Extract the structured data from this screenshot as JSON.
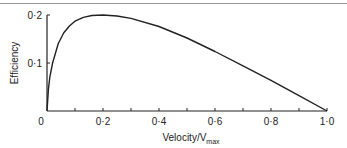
{
  "chart_data": {
    "type": "line",
    "title": "",
    "xlabel": "Velocity/V",
    "xlabel_sub": "max",
    "ylabel": "Efficiency",
    "xlim": [
      0,
      1.0
    ],
    "ylim": [
      0,
      0.2
    ],
    "x_ticks": [
      "0",
      "0·2",
      "0·4",
      "0·6",
      "0·8",
      "1·0"
    ],
    "y_ticks": [
      "0·1",
      "0·2"
    ],
    "grid": false,
    "legend": null,
    "series": [
      {
        "name": "Efficiency",
        "x": [
          0,
          0.005,
          0.01,
          0.02,
          0.04,
          0.06,
          0.08,
          0.1,
          0.13,
          0.16,
          0.2,
          0.25,
          0.3,
          0.4,
          0.5,
          0.6,
          0.7,
          0.8,
          0.9,
          1.0
        ],
        "values": [
          0,
          0.045,
          0.07,
          0.1,
          0.14,
          0.163,
          0.177,
          0.187,
          0.195,
          0.199,
          0.2,
          0.198,
          0.193,
          0.176,
          0.152,
          0.124,
          0.094,
          0.064,
          0.032,
          0
        ]
      }
    ]
  }
}
